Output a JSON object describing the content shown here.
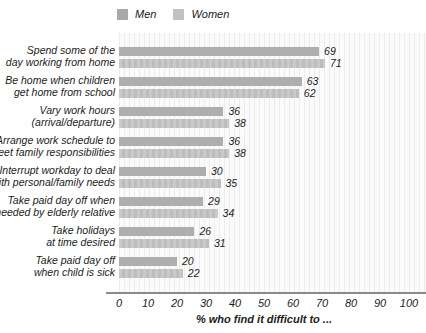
{
  "chart_data": {
    "type": "bar",
    "orientation": "horizontal",
    "title": "",
    "xlabel": "% who find it difficult to ...",
    "ylabel": "",
    "xlim": [
      0,
      100
    ],
    "xticks": [
      0,
      10,
      20,
      30,
      40,
      50,
      60,
      70,
      80,
      90,
      100
    ],
    "grid": "faint vertical pinstripe background, no gridlines",
    "legend_position": "top",
    "value_labels": "at end of each bar",
    "categories": [
      [
        "Spend some of the",
        "day working from home"
      ],
      [
        "Be home when children",
        "get home from school"
      ],
      [
        "Vary work hours",
        "(arrival/departure)"
      ],
      [
        "Arrange work schedule to",
        "meet family responsibilities"
      ],
      [
        "Interrupt workday to deal",
        "with personal/family needs"
      ],
      [
        "Take paid day off when",
        "needed by elderly relative"
      ],
      [
        "Take holidays",
        "at time desired"
      ],
      [
        "Take paid day off",
        "when child is sick"
      ]
    ],
    "series": [
      {
        "name": "Men",
        "color": "#aeaeae",
        "values": [
          69,
          63,
          36,
          36,
          30,
          29,
          26,
          20
        ]
      },
      {
        "name": "Women",
        "color": "#c2c2c2",
        "values": [
          71,
          62,
          38,
          38,
          35,
          34,
          31,
          22
        ]
      }
    ]
  },
  "colors": {
    "background": "#ffffff",
    "men_bar": "#aeaeae",
    "women_bar": "#c2c2c2",
    "axis_line": "#8a8a8a",
    "pinstripe": "#ececec",
    "text": "#1c1c1c"
  }
}
